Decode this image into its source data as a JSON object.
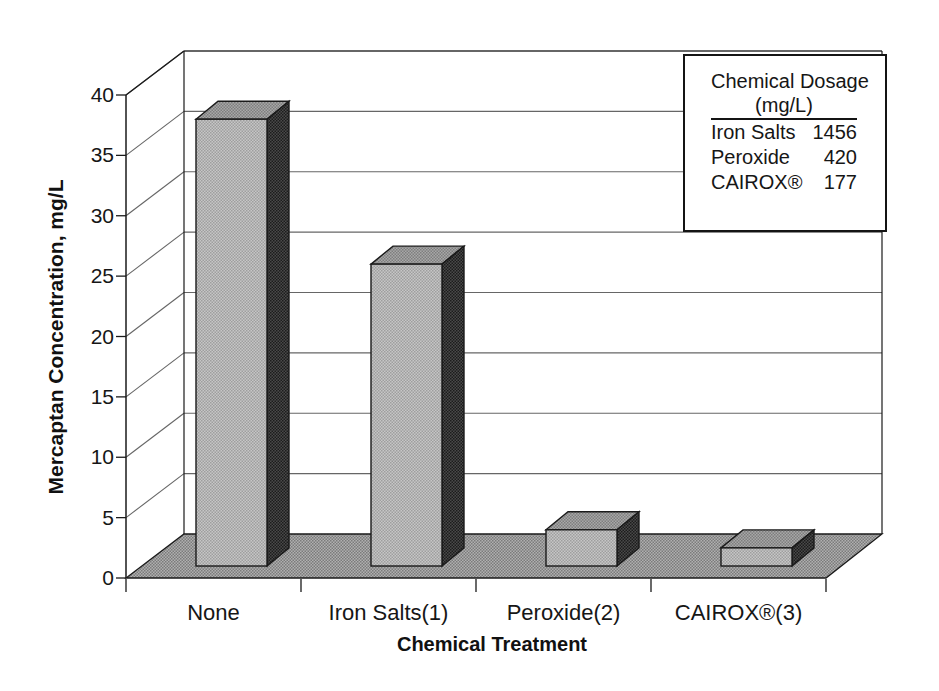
{
  "chart_data": {
    "type": "bar",
    "style": "3d-column",
    "categories": [
      "None",
      "Iron Salts(1)",
      "Peroxide(2)",
      "CAIROX®(3)"
    ],
    "values": [
      37,
      25,
      3,
      1.5
    ],
    "xlabel": "Chemical Treatment",
    "ylabel": "Mercaptan Concentration, mg/L",
    "yticks": [
      0,
      5,
      10,
      15,
      20,
      25,
      30,
      35,
      40
    ],
    "ylim": [
      0,
      40
    ],
    "grid": true,
    "legend_position": "top-right"
  },
  "legend": {
    "title": "Chemical Dosage",
    "subtitle": "(mg/L)",
    "rows": [
      {
        "label": "Iron Salts",
        "value": "1456"
      },
      {
        "label": "Peroxide",
        "value": "420"
      },
      {
        "label": "CAIROX®",
        "value": "177"
      }
    ]
  },
  "colors": {
    "background": "#ffffff",
    "text": "#141414",
    "line": "#1a1a1a",
    "grid": "#666666",
    "bar_front": "#c6c6c6",
    "bar_front_dot": "#9e9e9e",
    "bar_top": "#a8a8a8",
    "bar_top_dot": "#7e7e7e",
    "bar_side": "#4a4a4a",
    "bar_side_dot": "#1c1c1c",
    "floor": "#b0b0b0",
    "floor_dot": "#7b7b7b"
  }
}
